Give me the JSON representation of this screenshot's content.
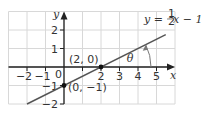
{
  "chart_data": {
    "type": "line",
    "title": "",
    "xlabel": "x",
    "ylabel": "y",
    "xlim": [
      -3,
      6
    ],
    "ylim": [
      -2.5,
      2.5
    ],
    "grid": true,
    "x_ticks": [
      "−2",
      "−1",
      "",
      "2",
      "3",
      "4",
      "5"
    ],
    "x_tick_values": [
      -2,
      -1,
      1,
      2,
      3,
      4,
      5
    ],
    "y_ticks": [
      "2",
      "1",
      "−1",
      "−2"
    ],
    "y_tick_values": [
      2,
      1,
      -1,
      -2
    ],
    "origin_label": "0",
    "series": [
      {
        "name": "y = ½x − 1",
        "slope": 0.5,
        "intercept": -1,
        "x_range": [
          -2,
          5.5
        ]
      }
    ],
    "points": [
      {
        "x": 2,
        "y": 0,
        "label": "(2, 0)"
      },
      {
        "x": 0,
        "y": -1,
        "label": "(0, −1)"
      }
    ],
    "annotations": {
      "equation_prefix": "y = ",
      "equation_frac_num": "1",
      "equation_frac_den": "2",
      "equation_suffix": "x − 1",
      "angle_label": "θ"
    },
    "colors": {
      "line": "#555555",
      "axis": "#222222",
      "grid": "#d8d8d8",
      "point": "#111111"
    }
  }
}
